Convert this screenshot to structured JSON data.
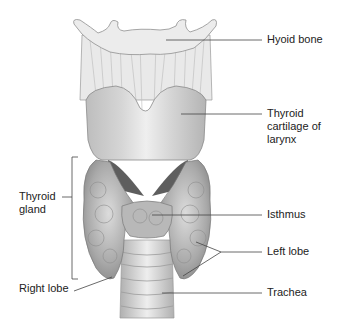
{
  "diagram": {
    "labels": {
      "hyoid_bone": "Hyoid bone",
      "thyroid_cartilage": "Thyroid\ncartilage of\nlarynx",
      "thyroid_gland": "Thyroid\ngland",
      "isthmus": "Isthmus",
      "left_lobe": "Left lobe",
      "right_lobe": "Right lobe",
      "trachea": "Trachea"
    },
    "colors": {
      "background": "#ffffff",
      "leader_line": "#444444",
      "text": "#222222",
      "tissue_light": "#e6e6e6",
      "tissue_mid": "#bdbdbd",
      "tissue_dark": "#8a8a8a"
    }
  }
}
